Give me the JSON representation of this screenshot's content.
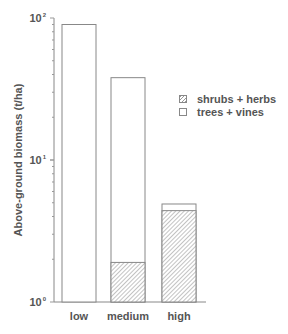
{
  "chart_data": {
    "type": "bar",
    "stacked": true,
    "yscale": "log",
    "title": "",
    "xlabel": "",
    "ylabel": "Above-ground biomass   (t/ha)",
    "ylim": [
      1,
      100
    ],
    "yticks": [
      "10⁰",
      "10¹",
      "10²"
    ],
    "categories": [
      "low",
      "medium",
      "high"
    ],
    "series": [
      {
        "name": "shrubs + herbs",
        "pattern": "hatched",
        "values": [
          0,
          1.9,
          4.4
        ]
      },
      {
        "name": "trees + vines",
        "pattern": "open",
        "values": [
          90,
          36.1,
          0.5
        ]
      }
    ],
    "totals": [
      90,
      38,
      4.9
    ],
    "legend_position": "right",
    "grid": false
  },
  "labels": {
    "ylabel": "Above-ground biomass   (t/ha)",
    "ytick0_base": "10",
    "ytick0_exp": "0",
    "ytick1_base": "10",
    "ytick1_exp": "1",
    "ytick2_base": "10",
    "ytick2_exp": "2",
    "x0": "low",
    "x1": "medium",
    "x2": "high",
    "legend0": "shrubs + herbs",
    "legend1": "trees + vines"
  }
}
